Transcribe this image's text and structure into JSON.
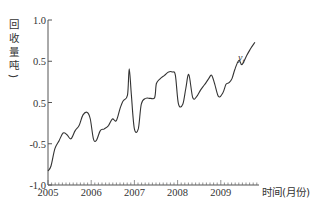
{
  "chart_data": {
    "type": "line",
    "title": "",
    "xlabel": "时间(月份)",
    "ylabel": "回收量(吨)",
    "ylabel_chars": [
      "回",
      "收",
      "量",
      "吨",
      ")"
    ],
    "x_ticks": [
      "2005",
      "2006",
      "2007",
      "2008",
      "2009"
    ],
    "y_ticks": [
      {
        "label": "1.0",
        "value": 1.0
      },
      {
        "label": "0.5",
        "value": 0.5
      },
      {
        "label": "0.5",
        "value": 0.0
      },
      {
        "label": "-0.5",
        "value": -0.5
      },
      {
        "label": "-1.0",
        "value": -1.0
      }
    ],
    "ylim": [
      -1.0,
      1.0
    ],
    "xlim": [
      "2005-01",
      "2009-12"
    ],
    "grid": false,
    "legend": "none",
    "series": [
      {
        "name": "y_t",
        "label_text": "y",
        "label_sub": "t",
        "color": "#333333",
        "x": [
          0,
          0.07,
          0.16,
          0.26,
          0.35,
          0.44,
          0.53,
          0.63,
          0.72,
          0.81,
          0.91,
          0.98,
          1.05,
          1.12,
          1.21,
          1.3,
          1.4,
          1.49,
          1.58,
          1.67,
          1.74,
          1.84,
          1.88,
          1.93,
          2.0,
          2.09,
          2.16,
          2.26,
          2.37,
          2.47,
          2.51,
          2.6,
          2.7,
          2.79,
          2.88,
          2.95,
          3.02,
          3.12,
          3.19,
          3.26,
          3.35,
          3.44,
          3.53,
          3.63,
          3.72,
          3.79,
          3.86,
          3.95,
          4.05,
          4.12,
          4.19,
          4.26,
          4.33,
          4.42,
          4.49,
          4.6,
          4.7,
          4.79
        ],
        "values": [
          -0.83,
          -0.77,
          -0.56,
          -0.46,
          -0.37,
          -0.39,
          -0.44,
          -0.34,
          -0.28,
          -0.15,
          -0.12,
          -0.2,
          -0.44,
          -0.46,
          -0.34,
          -0.32,
          -0.28,
          -0.2,
          -0.22,
          -0.07,
          0.02,
          0.09,
          0.41,
          0.09,
          -0.32,
          -0.32,
          -0.02,
          0.05,
          0.05,
          0.06,
          0.23,
          0.29,
          0.33,
          0.37,
          0.37,
          0.33,
          -0.02,
          -0.02,
          0.17,
          0.34,
          0.06,
          0.07,
          0.15,
          0.22,
          0.29,
          0.33,
          0.22,
          0.07,
          0.12,
          0.22,
          0.24,
          0.29,
          0.41,
          0.51,
          0.46,
          0.57,
          0.66,
          0.73
        ]
      }
    ]
  }
}
